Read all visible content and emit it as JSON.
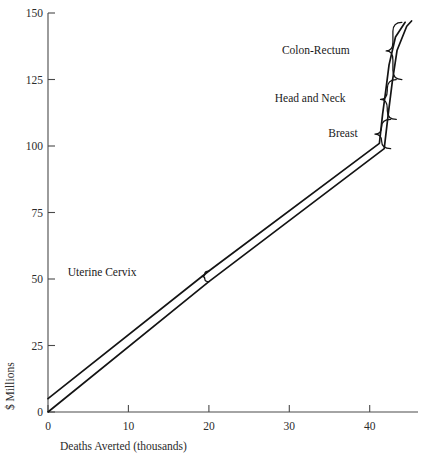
{
  "chart_data": {
    "type": "line",
    "title": "",
    "xlabel": "Deaths Averted (thousands)",
    "ylabel": "$ Millions",
    "xlim": [
      0,
      46
    ],
    "ylim": [
      0,
      150
    ],
    "grid": false,
    "legend_position": "none",
    "xticks": [
      0,
      10,
      20,
      30,
      40
    ],
    "xtick_labels": [
      "0",
      "10",
      "20",
      "30",
      "40"
    ],
    "yticks": [
      0,
      25,
      50,
      75,
      100,
      125,
      150
    ],
    "ytick_labels": [
      "0",
      "25",
      "50",
      "75",
      "100",
      "125",
      "150"
    ],
    "series": [
      {
        "name": "upper-bound-cost-curve",
        "points": [
          [
            0.0,
            5.0
          ],
          [
            20.0,
            53.0
          ],
          [
            41.2,
            101.0
          ],
          [
            41.6,
            112.0
          ],
          [
            42.0,
            121.0
          ],
          [
            42.4,
            130.5
          ],
          [
            43.2,
            141.0
          ],
          [
            44.4,
            146.5
          ]
        ]
      },
      {
        "name": "lower-bound-cost-curve",
        "points": [
          [
            0.0,
            0.0
          ],
          [
            20.0,
            49.0
          ],
          [
            41.8,
            99.0
          ],
          [
            42.3,
            112.0
          ],
          [
            42.8,
            124.0
          ],
          [
            43.4,
            136.0
          ],
          [
            44.6,
            145.0
          ],
          [
            45.2,
            147.0
          ]
        ]
      }
    ],
    "annotations": [
      {
        "label": "Colon-Rectum",
        "brace_x": 44.0,
        "brace_y_top": 146.5,
        "brace_y_bottom": 125.0,
        "label_x": 37.5,
        "label_y": 136.0
      },
      {
        "label": "Head and Neck",
        "brace_x": 43.3,
        "brace_y_top": 125.0,
        "brace_y_bottom": 110.0,
        "label_x": 37.0,
        "label_y": 118.0
      },
      {
        "label": "Breast",
        "brace_x": 42.6,
        "brace_y_top": 110.0,
        "brace_y_bottom": 99.0,
        "label_x": 38.5,
        "label_y": 105.0
      },
      {
        "label": "Uterine Cervix",
        "brace_x": 20.0,
        "brace_y_top": 53.0,
        "brace_y_bottom": 49.0,
        "label_x": 11.0,
        "label_y": 52.5
      }
    ]
  },
  "axes": {
    "y_axis_title": "$ Millions",
    "x_axis_title": "Deaths Averted (thousands)"
  },
  "colors": {
    "line": "#141414",
    "axis": "#4a4a4a",
    "text": "#1a1a1a",
    "background": "#ffffff"
  }
}
